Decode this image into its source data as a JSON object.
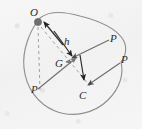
{
  "figure": {
    "type": "mechanics-free-body-diagram",
    "width": 142,
    "height": 129,
    "background_color": "#f3f3f3",
    "outline_color": "#8a8a8a",
    "line_color": "#555555",
    "dashed_color": "#9a9a9a",
    "marker_color": "#6f6f6f",
    "text_color": "#2a2a2a",
    "labels": [
      {
        "id": "O",
        "text": "O",
        "x": 30,
        "y": 8,
        "meaning": "pivot-point"
      },
      {
        "id": "h",
        "text": "h",
        "x": 64,
        "y": 40,
        "meaning": "lever-arm-height"
      },
      {
        "id": "G",
        "text": "G",
        "x": 56,
        "y": 62,
        "meaning": "centre-of-gravity"
      },
      {
        "id": "C",
        "text": "C",
        "x": 80,
        "y": 92,
        "meaning": "centre-of-pressure"
      },
      {
        "id": "P1",
        "text": "P",
        "x": 110,
        "y": 36,
        "meaning": "pressure-force-upper-right"
      },
      {
        "id": "P2",
        "text": "P",
        "x": 121,
        "y": 57,
        "meaning": "pressure-force-lower-right"
      },
      {
        "id": "P3",
        "text": "P",
        "x": 32,
        "y": 86,
        "meaning": "pressure-force-lower-left"
      }
    ],
    "points": [
      {
        "id": "O",
        "x": 38,
        "y": 22,
        "style": "filled-dot",
        "radius": 3.6
      },
      {
        "id": "G",
        "x": 68,
        "y": 60,
        "style": "arrow-cluster"
      },
      {
        "id": "C",
        "x": 88,
        "y": 86,
        "style": "arrow-tip"
      }
    ],
    "dashed_segments": [
      {
        "id": "O-vertical-drop",
        "x1": 38,
        "y1": 26,
        "x2": 40,
        "y2": 89
      },
      {
        "id": "O-to-C-diagonal",
        "x1": 40,
        "y1": 26,
        "x2": 90,
        "y2": 85
      }
    ],
    "arrows": [
      {
        "id": "arrow-to-O",
        "x1": 62,
        "y1": 44,
        "x2": 43,
        "y2": 21,
        "meaning": "resultant-toward-pivot"
      },
      {
        "id": "arrow-h-to-G",
        "x1": 55,
        "y1": 32,
        "x2": 71,
        "y2": 55,
        "meaning": "height-h-direction"
      },
      {
        "id": "arrow-P-upper-right",
        "x1": 107,
        "y1": 42,
        "x2": 70,
        "y2": 59,
        "meaning": "pressure-force-P-upper"
      },
      {
        "id": "arrow-P-lower-left",
        "x1": 43,
        "y1": 83,
        "x2": 75,
        "y2": 57,
        "meaning": "pressure-force-P-lower-left"
      },
      {
        "id": "arrow-P-lower-right",
        "x1": 118,
        "y1": 64,
        "x2": 86,
        "y2": 84,
        "meaning": "pressure-force-P-lower-right"
      },
      {
        "id": "arrow-G-down",
        "x1": 81,
        "y1": 55,
        "x2": 84,
        "y2": 80,
        "meaning": "weight-direction-G-to-C"
      }
    ],
    "outline_path": "M 40 18 C 30 30, 22 50, 24 68 C 26 88, 38 104, 55 111 C 72 118, 94 114, 108 100 C 120 88, 124 74, 121 62 C 126 56, 128 46, 122 38 C 114 27, 96 20, 80 16 C 66 12, 50 10, 40 18 Z"
  }
}
